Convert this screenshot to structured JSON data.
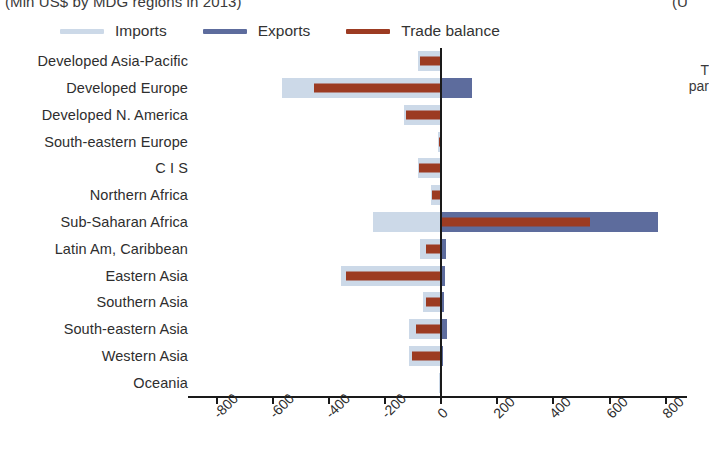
{
  "titles": {
    "main_clipped": "(Mln US$ by MDG regions in 2013)",
    "right_clipped": "(U"
  },
  "side_note": {
    "line1": "T",
    "line2": "par"
  },
  "legend": {
    "items": [
      {
        "label": "Imports",
        "color": "#ccd9e8"
      },
      {
        "label": "Exports",
        "color": "#5d6c9d"
      },
      {
        "label": "Trade balance",
        "color": "#9c3b22"
      }
    ]
  },
  "chart_data": {
    "type": "bar",
    "orientation": "horizontal",
    "title": "(Mln US$ by MDG regions in 2013)",
    "xlabel": "",
    "ylabel": "",
    "xlim": [
      -900,
      880
    ],
    "xticks": [
      -800,
      -600,
      -400,
      -200,
      0,
      200,
      400,
      600,
      800
    ],
    "xticklabels": [
      "-800",
      "-600",
      "-400",
      "-200",
      "0",
      "200",
      "400",
      "600",
      "800"
    ],
    "grid": false,
    "legend_position": "top",
    "categories": [
      "Developed Asia-Pacific",
      "Developed Europe",
      "Developed N. America",
      "South-eastern Europe",
      "C I S",
      "Northern Africa",
      "Sub-Saharan Africa",
      "Latin Am, Caribbean",
      "Eastern Asia",
      "Southern Asia",
      "South-eastern Asia",
      "Western Asia",
      "Oceania"
    ],
    "series": [
      {
        "name": "Imports",
        "color": "#ccd9e8",
        "values": [
          -78,
          -565,
          -128,
          -8,
          -80,
          -33,
          -240,
          -72,
          -355,
          -62,
          -110,
          -110,
          -4
        ]
      },
      {
        "name": "Exports",
        "color": "#5d6c9d",
        "values": [
          4,
          113,
          4,
          3,
          4,
          3,
          775,
          22,
          18,
          12,
          25,
          10,
          2
        ]
      },
      {
        "name": "Trade balance",
        "color": "#9c3b22",
        "values": [
          -74,
          -452,
          -124,
          -5,
          -76,
          -30,
          535,
          -50,
          -337,
          -50,
          -85,
          -100,
          -2
        ]
      }
    ]
  }
}
